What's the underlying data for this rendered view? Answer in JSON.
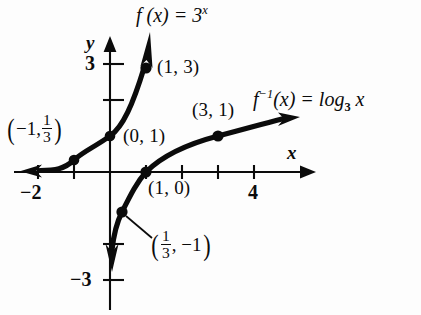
{
  "figure": {
    "type": "math-graph",
    "background_color": "#fdfdfd",
    "ink_color": "#0b0b0b"
  },
  "axes": {
    "x_axis_name": "x",
    "y_axis_name": "y",
    "x_tick_labels": [
      {
        "text": "−2",
        "value": -2
      },
      {
        "text": "4",
        "value": 4
      }
    ],
    "y_tick_labels": [
      {
        "text": "3",
        "value": 3
      },
      {
        "text": "−3",
        "value": -3
      }
    ],
    "x_range": [
      -2.7,
      5.5
    ],
    "y_range": [
      -3.7,
      3.9
    ],
    "x_ticks_all": [
      -2,
      -1,
      1,
      2,
      3,
      4
    ],
    "y_ticks_all": [
      3,
      2,
      -2,
      -3
    ],
    "unit_pixels": 36,
    "origin_px": [
      110,
      172
    ]
  },
  "curves": {
    "exponential": {
      "label": "f (x) = 3",
      "label_exponent": "x",
      "name": "exponential-curve",
      "equation": "f(x) = 3^x",
      "arrow": "up-right"
    },
    "logarithm": {
      "label_f": "f",
      "label_exp": "−1",
      "label_rest": "(x) = log",
      "label_base": "3",
      "label_tail": "x",
      "name": "logarithm-curve",
      "equation": "f^-1(x) = log_3 x",
      "arrow": "right"
    }
  },
  "points": [
    {
      "name": "point-neg1-onethird",
      "label_open": "(",
      "label_text": "−1, ",
      "frac_num": "1",
      "frac_den": "3",
      "label_close": ")",
      "x": -1,
      "y": 0.3333,
      "curve": "exponential",
      "style": "fraction"
    },
    {
      "name": "point-0-1",
      "label": "(0, 1)",
      "x": 0,
      "y": 1,
      "curve": "exponential",
      "style": "plain"
    },
    {
      "name": "point-1-3",
      "label": "(1, 3)",
      "x": 1,
      "y": 3,
      "curve": "exponential",
      "style": "plain"
    },
    {
      "name": "point-onethird-neg1",
      "label_open": "(",
      "frac_num": "1",
      "frac_den": "3",
      "label_text": ", −1",
      "label_close": ")",
      "x": 0.3333,
      "y": -1,
      "curve": "logarithm",
      "style": "fraction"
    },
    {
      "name": "point-1-0",
      "label": "(1, 0)",
      "x": 1,
      "y": 0,
      "curve": "logarithm",
      "style": "plain"
    },
    {
      "name": "point-3-1",
      "label": "(3, 1)",
      "x": 3,
      "y": 1,
      "curve": "logarithm",
      "style": "plain"
    }
  ]
}
